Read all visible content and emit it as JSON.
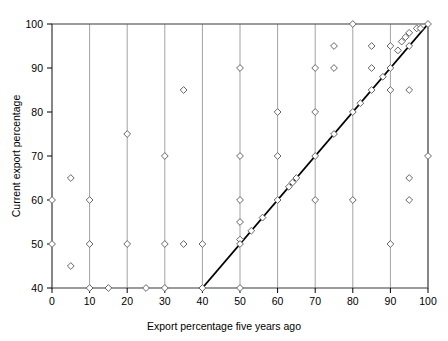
{
  "chart_data": {
    "type": "scatter",
    "title": "",
    "xlabel": "Export percentage five years ago",
    "ylabel": "Current export percentage",
    "xlim": [
      0,
      100
    ],
    "ylim": [
      40,
      100
    ],
    "xticks": [
      0,
      10,
      20,
      30,
      40,
      50,
      60,
      70,
      80,
      90,
      100
    ],
    "yticks": [
      40,
      50,
      60,
      70,
      80,
      90,
      100
    ],
    "xtick_labels": [
      "0",
      "10",
      "20",
      "30",
      "40",
      "50",
      "60",
      "70",
      "80",
      "90",
      "100"
    ],
    "ytick_labels": [
      "40",
      "50",
      "60",
      "70",
      "80",
      "90",
      "100"
    ],
    "grid": "vertical",
    "legend": "none",
    "marker": "open-diamond",
    "marker_color": "#555555",
    "reference_line": {
      "label": "identity line y=x",
      "x": [
        40,
        100
      ],
      "y": [
        40,
        100
      ],
      "color": "#000000"
    },
    "points": [
      {
        "x": 0,
        "y": 60
      },
      {
        "x": 0,
        "y": 50
      },
      {
        "x": 5,
        "y": 65
      },
      {
        "x": 5,
        "y": 45
      },
      {
        "x": 10,
        "y": 60
      },
      {
        "x": 10,
        "y": 50
      },
      {
        "x": 10,
        "y": 40
      },
      {
        "x": 15,
        "y": 40
      },
      {
        "x": 20,
        "y": 75
      },
      {
        "x": 20,
        "y": 50
      },
      {
        "x": 25,
        "y": 40
      },
      {
        "x": 30,
        "y": 70
      },
      {
        "x": 30,
        "y": 50
      },
      {
        "x": 30,
        "y": 40
      },
      {
        "x": 35,
        "y": 85
      },
      {
        "x": 35,
        "y": 50
      },
      {
        "x": 40,
        "y": 50
      },
      {
        "x": 40,
        "y": 40
      },
      {
        "x": 50,
        "y": 90
      },
      {
        "x": 50,
        "y": 70
      },
      {
        "x": 50,
        "y": 60
      },
      {
        "x": 50,
        "y": 55
      },
      {
        "x": 50,
        "y": 51
      },
      {
        "x": 50,
        "y": 50
      },
      {
        "x": 50,
        "y": 40
      },
      {
        "x": 53,
        "y": 53
      },
      {
        "x": 56,
        "y": 56
      },
      {
        "x": 60,
        "y": 80
      },
      {
        "x": 60,
        "y": 70
      },
      {
        "x": 60,
        "y": 60
      },
      {
        "x": 63,
        "y": 63
      },
      {
        "x": 64,
        "y": 64
      },
      {
        "x": 65,
        "y": 65
      },
      {
        "x": 70,
        "y": 90
      },
      {
        "x": 70,
        "y": 80
      },
      {
        "x": 70,
        "y": 70
      },
      {
        "x": 70,
        "y": 60
      },
      {
        "x": 75,
        "y": 95
      },
      {
        "x": 75,
        "y": 90
      },
      {
        "x": 75,
        "y": 75
      },
      {
        "x": 80,
        "y": 100
      },
      {
        "x": 80,
        "y": 80
      },
      {
        "x": 80,
        "y": 60
      },
      {
        "x": 82,
        "y": 82
      },
      {
        "x": 85,
        "y": 95
      },
      {
        "x": 85,
        "y": 90
      },
      {
        "x": 85,
        "y": 85
      },
      {
        "x": 88,
        "y": 88
      },
      {
        "x": 90,
        "y": 95
      },
      {
        "x": 90,
        "y": 90
      },
      {
        "x": 90,
        "y": 85
      },
      {
        "x": 90,
        "y": 50
      },
      {
        "x": 92,
        "y": 94
      },
      {
        "x": 93,
        "y": 96
      },
      {
        "x": 94,
        "y": 97
      },
      {
        "x": 95,
        "y": 98
      },
      {
        "x": 95,
        "y": 95
      },
      {
        "x": 95,
        "y": 85
      },
      {
        "x": 95,
        "y": 65
      },
      {
        "x": 95,
        "y": 60
      },
      {
        "x": 97,
        "y": 99
      },
      {
        "x": 98,
        "y": 99
      },
      {
        "x": 100,
        "y": 100
      },
      {
        "x": 100,
        "y": 70
      }
    ]
  }
}
